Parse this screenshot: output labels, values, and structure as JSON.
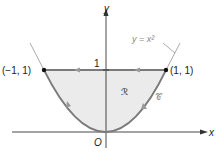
{
  "diagram": {
    "axes": {
      "x_label": "x",
      "y_label": "y",
      "origin_label": "O"
    },
    "tick_label_y": "1",
    "curve_label": "y = x²",
    "region_label": "ℛ",
    "boundary_label": "𝒞",
    "points": [
      {
        "label": "(−1, 1)",
        "x": -1,
        "y": 1
      },
      {
        "label": "(1, 1)",
        "x": 1,
        "y": 1
      }
    ],
    "colors": {
      "fill": "#ebebeb",
      "curve": "#7a7a7a",
      "axis": "#333333",
      "dashed": "#aaaaaa"
    }
  }
}
